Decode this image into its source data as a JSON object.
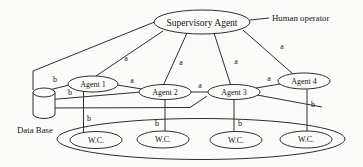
{
  "diagram": {
    "nodes": {
      "supervisory_agent": {
        "label": "Supervisory Agent"
      },
      "human_operator": {
        "label": "Human operator"
      },
      "agent1": {
        "label": "Agent 1"
      },
      "agent2": {
        "label": "Agent 2"
      },
      "agent3": {
        "label": "Agent 3"
      },
      "agent4": {
        "label": "Agent 4"
      },
      "database": {
        "label": "Data Base"
      },
      "workcells": [
        {
          "label": "W.C."
        },
        {
          "label": "W.C."
        },
        {
          "label": "W.C."
        },
        {
          "label": "W.C."
        }
      ]
    },
    "edge_labels": {
      "sa_agent1": "a",
      "sa_agent2": "a",
      "sa_agent3": "a",
      "sa_agent4": "a",
      "agent1_agent2": "a",
      "agent2_agent3": "a",
      "agent3_agent4": "a",
      "db_agent1": "b",
      "db_agent2": "b",
      "agent1_wc": "b",
      "agent2_wc": "b",
      "agent3_wc": "b",
      "agent4_wc": "b"
    },
    "colors": {
      "line": "#2e2e2e",
      "text": "#161616",
      "background": "#fbfbfa"
    }
  }
}
